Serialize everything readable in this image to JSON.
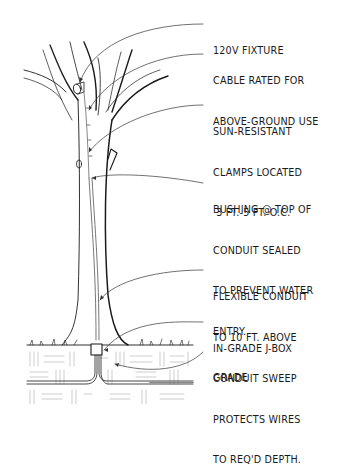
{
  "diagram": {
    "callouts": [
      {
        "id": "fixture",
        "lines": [
          "120V FIXTURE"
        ]
      },
      {
        "id": "cable",
        "lines": [
          "CABLE RATED FOR",
          "ABOVE-GROUND USE"
        ]
      },
      {
        "id": "clamps",
        "lines": [
          "SUN-RESISTANT",
          "CLAMPS LOCATED",
          " 3 FT.-5 FT. O.C."
        ]
      },
      {
        "id": "bushing",
        "lines": [
          "BUSHING @ TOP OF",
          "CONDUIT SEALED",
          "TO PREVENT WATER",
          "ENTRY."
        ]
      },
      {
        "id": "flex-conduit",
        "lines": [
          "FLEXIBLE CONDUIT",
          "TO 10 FT. ABOVE",
          "GRADE"
        ]
      },
      {
        "id": "jbox",
        "lines": [
          "IN-GRADE J-BOX"
        ]
      },
      {
        "id": "sweep",
        "lines": [
          "CONDUIT SWEEP",
          "PROTECTS WIRES",
          "TO REQ'D DEPTH."
        ]
      }
    ],
    "colors": {
      "ink": "#1a1a1a",
      "light_ink": "#777777",
      "background": "#ffffff"
    }
  }
}
